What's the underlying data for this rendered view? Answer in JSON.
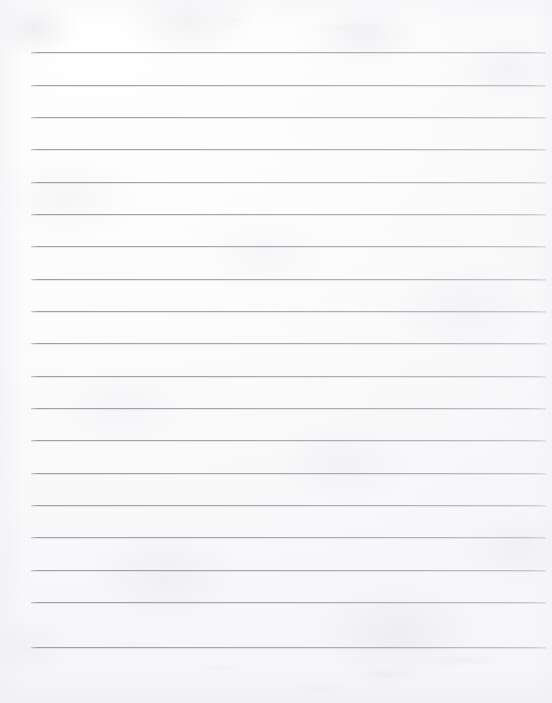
{
  "document": {
    "kind": "scanned-ruled-paper",
    "title": "Blank Ruled Notebook Paper",
    "page_width": 552,
    "page_height": 703,
    "content_text": "",
    "handwriting_present": false,
    "printed_text_present": false
  },
  "paper": {
    "background_color": "#fdfdfd",
    "base_tint": "#f8f8fa",
    "highlight_color": "#ffffff",
    "texture": "mottled scan grain with faint show-through",
    "edge_shading_color": "#f0f0f4"
  },
  "ruling": {
    "line_color": "#a4a4ac",
    "line_color_light": "#b8b8bc",
    "line_thickness_px": 1,
    "line_count": 19,
    "first_line_y": 52,
    "line_spacing_px": 32.2,
    "left_margin_x": 31,
    "right_end_x": 546,
    "line_length_px": 515,
    "has_vertical_margin_rule": false,
    "has_holes": false,
    "lines": [
      {
        "index": 1,
        "y": 52,
        "x_start": 31,
        "x_end": 546,
        "content": ""
      },
      {
        "index": 2,
        "y": 85,
        "x_start": 31,
        "x_end": 546,
        "content": ""
      },
      {
        "index": 3,
        "y": 117,
        "x_start": 31,
        "x_end": 546,
        "content": ""
      },
      {
        "index": 4,
        "y": 149,
        "x_start": 31,
        "x_end": 546,
        "content": ""
      },
      {
        "index": 5,
        "y": 182,
        "x_start": 31,
        "x_end": 546,
        "content": ""
      },
      {
        "index": 6,
        "y": 214,
        "x_start": 31,
        "x_end": 546,
        "content": ""
      },
      {
        "index": 7,
        "y": 246,
        "x_start": 31,
        "x_end": 546,
        "content": ""
      },
      {
        "index": 8,
        "y": 279,
        "x_start": 31,
        "x_end": 546,
        "content": ""
      },
      {
        "index": 9,
        "y": 311,
        "x_start": 31,
        "x_end": 546,
        "content": ""
      },
      {
        "index": 10,
        "y": 343,
        "x_start": 31,
        "x_end": 546,
        "content": ""
      },
      {
        "index": 11,
        "y": 376,
        "x_start": 31,
        "x_end": 546,
        "content": ""
      },
      {
        "index": 12,
        "y": 408,
        "x_start": 31,
        "x_end": 546,
        "content": ""
      },
      {
        "index": 13,
        "y": 440,
        "x_start": 31,
        "x_end": 546,
        "content": ""
      },
      {
        "index": 14,
        "y": 473,
        "x_start": 31,
        "x_end": 546,
        "content": ""
      },
      {
        "index": 15,
        "y": 505,
        "x_start": 31,
        "x_end": 546,
        "content": ""
      },
      {
        "index": 16,
        "y": 537,
        "x_start": 31,
        "x_end": 546,
        "content": ""
      },
      {
        "index": 17,
        "y": 570,
        "x_start": 31,
        "x_end": 546,
        "content": ""
      },
      {
        "index": 18,
        "y": 602,
        "x_start": 31,
        "x_end": 546,
        "content": ""
      },
      {
        "index": 19,
        "y": 647,
        "x_start": 31,
        "x_end": 546,
        "content": ""
      }
    ]
  }
}
